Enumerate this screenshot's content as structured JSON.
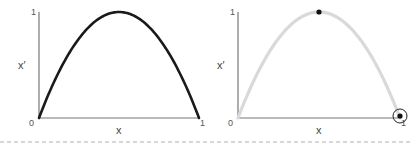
{
  "chart_data": [
    {
      "type": "line",
      "title": "",
      "xlabel": "x",
      "ylabel": "x′",
      "xlim": [
        0,
        1
      ],
      "ylim": [
        0,
        1
      ],
      "x_ticks": [
        "0",
        "1"
      ],
      "y_ticks": [
        "1"
      ],
      "grid": false,
      "series": [
        {
          "name": "x' = 4x(1-x)",
          "color": "#1a1a1a",
          "function": "4x(1-x)",
          "x": [
            0,
            0.1,
            0.2,
            0.3,
            0.4,
            0.5,
            0.6,
            0.7,
            0.8,
            0.9,
            1.0
          ],
          "y": [
            0,
            0.36,
            0.64,
            0.84,
            0.96,
            1.0,
            0.96,
            0.84,
            0.64,
            0.36,
            0
          ]
        }
      ]
    },
    {
      "type": "line",
      "title": "",
      "xlabel": "x",
      "ylabel": "x′",
      "xlim": [
        0,
        1
      ],
      "ylim": [
        0,
        1
      ],
      "x_ticks": [
        "0",
        "1"
      ],
      "y_ticks": [
        "1"
      ],
      "grid": false,
      "series": [
        {
          "name": "x' = 4x(1-x)",
          "color": "#d9d9d9",
          "function": "4x(1-x)",
          "x": [
            0,
            0.1,
            0.2,
            0.3,
            0.4,
            0.5,
            0.6,
            0.7,
            0.8,
            0.9,
            1.0
          ],
          "y": [
            0,
            0.36,
            0.64,
            0.84,
            0.96,
            1.0,
            0.96,
            0.84,
            0.64,
            0.36,
            0
          ]
        }
      ],
      "points": [
        {
          "name": "peak",
          "x": 0.5,
          "y": 1.0,
          "style": "filled-dot"
        },
        {
          "name": "endpoint",
          "x": 1.0,
          "y": 0.0,
          "style": "circled-dot"
        }
      ]
    }
  ]
}
